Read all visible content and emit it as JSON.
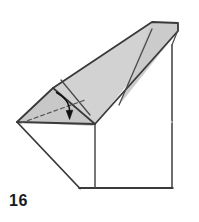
{
  "figure": {
    "kind": "origami-fold-diagram",
    "step_label": "16",
    "title": "Origami folding step 16",
    "colors": {
      "paper_front": "#d2d2d2",
      "paper_front_shaded": "#c6c6c6",
      "paper_back": "#ffffff",
      "outline": "#3a3a3a",
      "fold_line": "#4a4a4a",
      "dashed_line": "#555555",
      "arrow": "#111111",
      "background": "#ffffff",
      "label": "#1a1a1a"
    },
    "annotations": {
      "valley_fold_dashed": "dashed crease line",
      "fold_arrow": "curved arrow indicating fold direction downward"
    },
    "geometry": {
      "gray_flap_outer": "17,122 53,88 152,22 178,22 178,30 95,124",
      "gray_flap_inner_ridge": "53,88 95,124",
      "gray_crease_a": "60,81 90,116",
      "gray_crease_b": "152,28 120,104",
      "base_left_edge": "17,122 80,188",
      "base_top_edge": "17,122 95,122",
      "base_bottom_edge": "80,188 172,188",
      "base_right_edge": "172,188 172,45",
      "dashed_crease": "22,123 84,101",
      "arrow_path": "57,93 70,104 69,116"
    },
    "viewbox": "0 0 199 222"
  }
}
